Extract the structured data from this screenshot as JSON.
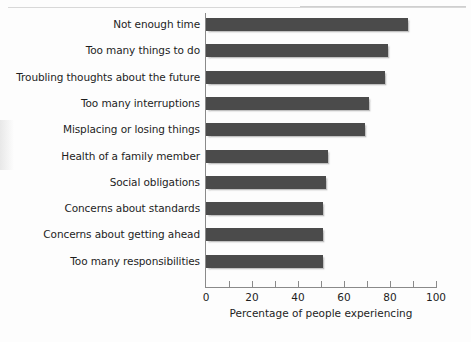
{
  "chart_data": {
    "type": "bar",
    "orientation": "horizontal",
    "title": "",
    "xlabel": "Percentage of people experiencing",
    "ylabel": "",
    "xlim": [
      0,
      100
    ],
    "xticks": [
      0,
      20,
      40,
      60,
      80,
      100
    ],
    "xtick_labels": [
      "0",
      "20",
      "40",
      "60",
      "80",
      "100"
    ],
    "minor_xticks": [
      10,
      30,
      50,
      70,
      90
    ],
    "grid": false,
    "legend": null,
    "bar_color": "#4b4b4b",
    "axis_color": "#8a8a8a",
    "categories": [
      "Not enough time",
      "Too many things to do",
      "Troubling thoughts about the future",
      "Too many interruptions",
      "Misplacing or losing things",
      "Health of a family member",
      "Social obligations",
      "Concerns about standards",
      "Concerns about getting ahead",
      "Too many responsibilities"
    ],
    "values": [
      88,
      79,
      78,
      71,
      69,
      53,
      52,
      51,
      51,
      51
    ]
  }
}
